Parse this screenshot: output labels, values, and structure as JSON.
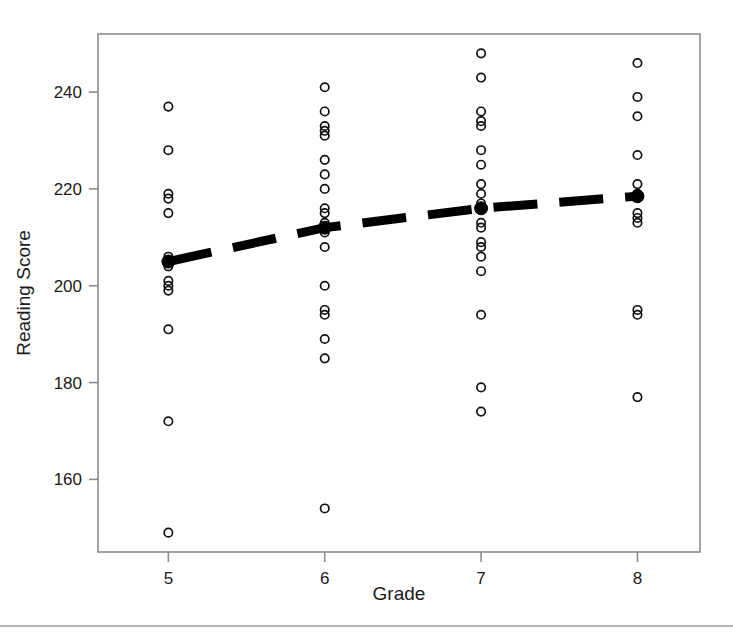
{
  "chart_data": {
    "type": "scatter",
    "title": "",
    "xlabel": "Grade",
    "ylabel": "Reading Score",
    "xlim": [
      4.55,
      8.4
    ],
    "ylim": [
      145,
      252
    ],
    "grid": false,
    "legend": null,
    "xticks": [
      5,
      6,
      7,
      8
    ],
    "xticklabels": [
      "5",
      "6",
      "7",
      "8"
    ],
    "yticks": [
      160,
      180,
      200,
      220,
      240
    ],
    "yticklabels": [
      "160",
      "180",
      "200",
      "220",
      "240"
    ],
    "categories": [
      "5",
      "6",
      "7",
      "8"
    ],
    "series": [
      {
        "name": "Reading Score observations",
        "marker": "open-circle",
        "points": [
          {
            "x": 5,
            "y": 237
          },
          {
            "x": 5,
            "y": 228
          },
          {
            "x": 5,
            "y": 219
          },
          {
            "x": 5,
            "y": 218
          },
          {
            "x": 5,
            "y": 215
          },
          {
            "x": 5,
            "y": 206
          },
          {
            "x": 5,
            "y": 205
          },
          {
            "x": 5,
            "y": 204
          },
          {
            "x": 5,
            "y": 201
          },
          {
            "x": 5,
            "y": 200
          },
          {
            "x": 5,
            "y": 199
          },
          {
            "x": 5,
            "y": 191
          },
          {
            "x": 5,
            "y": 172
          },
          {
            "x": 5,
            "y": 149
          },
          {
            "x": 6,
            "y": 241
          },
          {
            "x": 6,
            "y": 236
          },
          {
            "x": 6,
            "y": 233
          },
          {
            "x": 6,
            "y": 232
          },
          {
            "x": 6,
            "y": 231
          },
          {
            "x": 6,
            "y": 226
          },
          {
            "x": 6,
            "y": 223
          },
          {
            "x": 6,
            "y": 220
          },
          {
            "x": 6,
            "y": 216
          },
          {
            "x": 6,
            "y": 215
          },
          {
            "x": 6,
            "y": 213
          },
          {
            "x": 6,
            "y": 212
          },
          {
            "x": 6,
            "y": 211
          },
          {
            "x": 6,
            "y": 208
          },
          {
            "x": 6,
            "y": 200
          },
          {
            "x": 6,
            "y": 195
          },
          {
            "x": 6,
            "y": 194
          },
          {
            "x": 6,
            "y": 189
          },
          {
            "x": 6,
            "y": 185
          },
          {
            "x": 6,
            "y": 154
          },
          {
            "x": 7,
            "y": 248
          },
          {
            "x": 7,
            "y": 243
          },
          {
            "x": 7,
            "y": 236
          },
          {
            "x": 7,
            "y": 234
          },
          {
            "x": 7,
            "y": 233
          },
          {
            "x": 7,
            "y": 228
          },
          {
            "x": 7,
            "y": 225
          },
          {
            "x": 7,
            "y": 221
          },
          {
            "x": 7,
            "y": 219
          },
          {
            "x": 7,
            "y": 217
          },
          {
            "x": 7,
            "y": 216
          },
          {
            "x": 7,
            "y": 213
          },
          {
            "x": 7,
            "y": 212
          },
          {
            "x": 7,
            "y": 209
          },
          {
            "x": 7,
            "y": 208
          },
          {
            "x": 7,
            "y": 206
          },
          {
            "x": 7,
            "y": 203
          },
          {
            "x": 7,
            "y": 194
          },
          {
            "x": 7,
            "y": 179
          },
          {
            "x": 7,
            "y": 174
          },
          {
            "x": 8,
            "y": 246
          },
          {
            "x": 8,
            "y": 239
          },
          {
            "x": 8,
            "y": 235
          },
          {
            "x": 8,
            "y": 227
          },
          {
            "x": 8,
            "y": 221
          },
          {
            "x": 8,
            "y": 219
          },
          {
            "x": 8,
            "y": 215
          },
          {
            "x": 8,
            "y": 214
          },
          {
            "x": 8,
            "y": 213
          },
          {
            "x": 8,
            "y": 195
          },
          {
            "x": 8,
            "y": 194
          },
          {
            "x": 8,
            "y": 177
          }
        ]
      },
      {
        "name": "Group means",
        "marker": "filled-circle",
        "line": "dashed",
        "x": [
          5,
          6,
          7,
          8
        ],
        "values": [
          205,
          212,
          216,
          218.5
        ]
      }
    ]
  },
  "axes": {
    "x_axis_title": "Grade",
    "y_axis_title": "Reading Score"
  }
}
